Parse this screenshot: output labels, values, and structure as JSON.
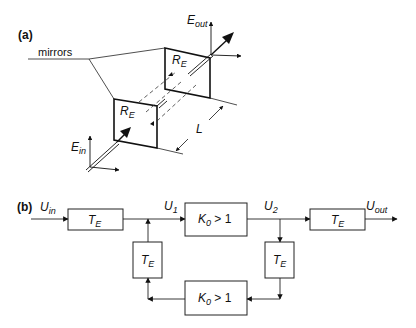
{
  "panel_a": {
    "label": "(a)",
    "mirrors_label": "mirrors",
    "mirror_labels": [
      {
        "main": "R",
        "sub": "E"
      },
      {
        "main": "R",
        "sub": "E"
      }
    ],
    "input_field": {
      "main": "E",
      "sub": "in"
    },
    "output_field": {
      "main": "E",
      "sub": "out"
    },
    "length_label": "L"
  },
  "panel_b": {
    "label": "(b)",
    "input": {
      "main": "U",
      "sub": "in"
    },
    "u1": {
      "main": "U",
      "sub": "1"
    },
    "u2": {
      "main": "U",
      "sub": "2"
    },
    "output": {
      "main": "U",
      "sub": "out"
    },
    "blocks": {
      "te_in": {
        "main": "T",
        "sub": "E"
      },
      "te_out": {
        "main": "T",
        "sub": "E"
      },
      "te_feedback_left": {
        "main": "T",
        "sub": "E"
      },
      "te_feedback_right": {
        "main": "T",
        "sub": "E"
      },
      "amp_forward": {
        "main": "K",
        "sub": "0",
        "rest": " > 1"
      },
      "amp_feedback": {
        "main": "K",
        "sub": "0",
        "rest": " > 1"
      }
    }
  }
}
